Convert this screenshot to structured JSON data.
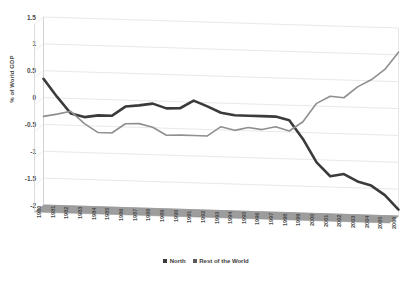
{
  "chart_data": {
    "type": "line",
    "title": "",
    "xlabel": "",
    "ylabel": "% of World GDP",
    "ylim": [
      -2,
      1.5
    ],
    "ystep": 0.5,
    "grid": true,
    "legend_position": "bottom-center",
    "projection": "3d",
    "categories": [
      "1980",
      "1981",
      "1982",
      "1983",
      "1984",
      "1985",
      "1986",
      "1987",
      "1988",
      "1989",
      "1990",
      "1991",
      "1992",
      "1993",
      "1994",
      "1995",
      "1996",
      "1997",
      "1998",
      "1999",
      "2000",
      "2001",
      "2002",
      "2003",
      "2004",
      "2005",
      "2006"
    ],
    "ytick_labels": [
      "1.5",
      "1",
      "0.5",
      "0",
      "-0.5",
      "-1",
      "-1.5",
      "-2"
    ],
    "ytick_values": [
      1.5,
      1,
      0.5,
      0,
      -0.5,
      -1,
      -1.5,
      -2
    ],
    "series": [
      {
        "name": "North",
        "color": "#3b3b3b",
        "width": 2.6,
        "values": [
          0.35,
          0.02,
          -0.28,
          -0.34,
          -0.3,
          -0.3,
          -0.12,
          -0.09,
          -0.05,
          -0.13,
          -0.12,
          0.03,
          -0.07,
          -0.18,
          -0.22,
          -0.22,
          -0.22,
          -0.22,
          -0.28,
          -0.62,
          -1.05,
          -1.3,
          -1.25,
          -1.38,
          -1.45,
          -1.62,
          -1.88
        ]
      },
      {
        "name": "Rest of the World",
        "color": "#8f8f8f",
        "width": 1.6,
        "values": [
          -0.35,
          -0.3,
          -0.24,
          -0.46,
          -0.62,
          -0.62,
          -0.44,
          -0.43,
          -0.49,
          -0.63,
          -0.62,
          -0.62,
          -0.62,
          -0.44,
          -0.5,
          -0.44,
          -0.47,
          -0.41,
          -0.48,
          -0.3,
          0.05,
          0.19,
          0.17,
          0.38,
          0.52,
          0.72,
          1.05
        ]
      }
    ],
    "legend": [
      {
        "label": "North",
        "color": "#3b3b3b"
      },
      {
        "label": "Rest of the World",
        "color": "#5a5a5a"
      }
    ]
  }
}
